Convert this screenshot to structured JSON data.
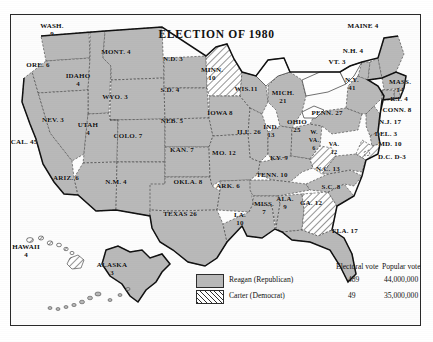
{
  "map": {
    "title": "ELECTION OF 1980"
  },
  "legend": {
    "header_electoral": "Electoral vote",
    "header_popular": "Popular vote",
    "rows": [
      {
        "key": "reagan",
        "swatch": "solid-gray-swatch",
        "name": "Reagan (Republican)",
        "electoral": "489",
        "popular": "44,000,000",
        "color": "#b9b9b9"
      },
      {
        "key": "carter",
        "swatch": "diagonal-hatch-swatch",
        "name": "Carter (Democrat)",
        "electoral": "49",
        "popular": "35,000,000",
        "color": "#ffffff"
      }
    ]
  },
  "states": [
    {
      "id": "wash",
      "label": "WASH.",
      "votes": "9",
      "winner": "reagan",
      "x": 52,
      "y": 30
    },
    {
      "id": "ore",
      "label": "ORE. 6",
      "votes": "",
      "winner": "reagan",
      "x": 35,
      "y": 64
    },
    {
      "id": "idaho",
      "label": "IDAHO",
      "votes": "4",
      "winner": "reagan",
      "x": 76,
      "y": 78
    },
    {
      "id": "mont",
      "label": "MONT. 4",
      "votes": "",
      "winner": "reagan",
      "x": 113,
      "y": 53
    },
    {
      "id": "wyo",
      "label": "WYO. 3",
      "votes": "",
      "winner": "reagan",
      "x": 113,
      "y": 94
    },
    {
      "id": "nev",
      "label": "NEV. 3",
      "votes": "",
      "winner": "reagan",
      "x": 52,
      "y": 119
    },
    {
      "id": "utah",
      "label": "UTAH",
      "votes": "4",
      "winner": "reagan",
      "x": 86,
      "y": 127
    },
    {
      "id": "cal",
      "label": "CAL. 45",
      "votes": "",
      "winner": "reagan",
      "x": 22,
      "y": 143
    },
    {
      "id": "ariz",
      "label": "ARIZ. 6",
      "votes": "",
      "winner": "reagan",
      "x": 64,
      "y": 176
    },
    {
      "id": "colo",
      "label": "COLO. 7",
      "votes": "",
      "winner": "reagan",
      "x": 125,
      "y": 135
    },
    {
      "id": "nm",
      "label": "N.M. 4",
      "votes": "",
      "winner": "reagan",
      "x": 114,
      "y": 181
    },
    {
      "id": "nd",
      "label": "N.D. 3",
      "votes": "",
      "winner": "reagan",
      "x": 172,
      "y": 60
    },
    {
      "id": "sd",
      "label": "S.D. 4",
      "votes": "",
      "winner": "reagan",
      "x": 168,
      "y": 90
    },
    {
      "id": "neb",
      "label": "NEB. 5",
      "votes": "",
      "winner": "reagan",
      "x": 170,
      "y": 120
    },
    {
      "id": "kan",
      "label": "KAN. 7",
      "votes": "",
      "winner": "reagan",
      "x": 180,
      "y": 148
    },
    {
      "id": "okla",
      "label": "OKLA. 8",
      "votes": "",
      "winner": "reagan",
      "x": 187,
      "y": 180
    },
    {
      "id": "texas",
      "label": "TEXAS 26",
      "votes": "",
      "winner": "reagan",
      "x": 180,
      "y": 213
    },
    {
      "id": "minn",
      "label": "MINN.",
      "votes": "10",
      "winner": "carter",
      "x": 211,
      "y": 73
    },
    {
      "id": "iowa",
      "label": "IOWA 8",
      "votes": "",
      "winner": "reagan",
      "x": 218,
      "y": 113
    },
    {
      "id": "mo",
      "label": "MO. 12",
      "votes": "",
      "winner": "reagan",
      "x": 222,
      "y": 152
    },
    {
      "id": "ark",
      "label": "ARK. 6",
      "votes": "",
      "winner": "reagan",
      "x": 226,
      "y": 185
    },
    {
      "id": "la",
      "label": "LA.",
      "votes": "10",
      "winner": "reagan",
      "x": 238,
      "y": 218
    },
    {
      "id": "wis",
      "label": "WIS.11",
      "votes": "",
      "winner": "reagan",
      "x": 245,
      "y": 88
    },
    {
      "id": "ill",
      "label": "ILL. 26",
      "votes": "",
      "winner": "reagan",
      "x": 247,
      "y": 131
    },
    {
      "id": "miss",
      "label": "MISS.",
      "votes": "7",
      "winner": "reagan",
      "x": 262,
      "y": 207
    },
    {
      "id": "mich",
      "label": "MICH.",
      "votes": "21",
      "winner": "reagan",
      "x": 281,
      "y": 96
    },
    {
      "id": "ind",
      "label": "IND.",
      "votes": "13",
      "winner": "reagan",
      "x": 270,
      "y": 132
    },
    {
      "id": "ohio",
      "label": "OHIO",
      "votes": "25",
      "winner": "reagan",
      "x": 296,
      "y": 126
    },
    {
      "id": "ky",
      "label": "KY. 9",
      "votes": "",
      "winner": "reagan",
      "x": 278,
      "y": 158
    },
    {
      "id": "tenn",
      "label": "TENN. 10",
      "votes": "",
      "winner": "reagan",
      "x": 271,
      "y": 174
    },
    {
      "id": "ala",
      "label": "ALA.",
      "votes": "9",
      "winner": "reagan",
      "x": 284,
      "y": 202
    },
    {
      "id": "ga",
      "label": "GA. 12",
      "votes": "",
      "winner": "carter",
      "x": 310,
      "y": 203
    },
    {
      "id": "fla",
      "label": "FLA. 17",
      "votes": "",
      "winner": "reagan",
      "x": 344,
      "y": 230
    },
    {
      "id": "sc",
      "label": "S.C. 8",
      "votes": "",
      "winner": "reagan",
      "x": 330,
      "y": 186
    },
    {
      "id": "nc",
      "label": "N.C. 13",
      "votes": "",
      "winner": "reagan",
      "x": 327,
      "y": 168
    },
    {
      "id": "wva",
      "label": "W.",
      "votes": "VA. 6",
      "winner": "carter",
      "x": 314,
      "y": 139
    },
    {
      "id": "va",
      "label": "VA.",
      "votes": "12",
      "winner": "reagan",
      "x": 333,
      "y": 146
    },
    {
      "id": "penn",
      "label": "PENN. 27",
      "votes": "",
      "winner": "reagan",
      "x": 325,
      "y": 112
    },
    {
      "id": "ny",
      "label": "N.Y.",
      "votes": "41",
      "winner": "reagan",
      "x": 350,
      "y": 83
    },
    {
      "id": "vt",
      "label": "VT. 3",
      "votes": "",
      "winner": "reagan",
      "x": 336,
      "y": 61
    },
    {
      "id": "nh",
      "label": "N.H. 4",
      "votes": "",
      "winner": "reagan",
      "x": 352,
      "y": 51
    },
    {
      "id": "maine",
      "label": "MAINE 4",
      "votes": "",
      "winner": "reagan",
      "x": 362,
      "y": 27
    },
    {
      "id": "mass",
      "label": "MASS.",
      "votes": "14",
      "winner": "reagan",
      "x": 399,
      "y": 85
    },
    {
      "id": "ri",
      "label": "R.I. 4",
      "votes": "",
      "winner": "reagan",
      "x": 399,
      "y": 97
    },
    {
      "id": "conn",
      "label": "CONN. 8",
      "votes": "",
      "winner": "reagan",
      "x": 396,
      "y": 109
    },
    {
      "id": "nj",
      "label": "N.J. 17",
      "votes": "",
      "winner": "reagan",
      "x": 389,
      "y": 121
    },
    {
      "id": "del",
      "label": "DEL. 3",
      "votes": "",
      "winner": "reagan",
      "x": 385,
      "y": 133
    },
    {
      "id": "md",
      "label": "MD. 10",
      "votes": "",
      "winner": "carter",
      "x": 389,
      "y": 143
    },
    {
      "id": "dc",
      "label": "D.C. D-3",
      "votes": "",
      "winner": "carter",
      "x": 390,
      "y": 156
    },
    {
      "id": "alaska",
      "label": "ALASKA",
      "votes": "3",
      "winner": "reagan",
      "x": 110,
      "y": 268
    },
    {
      "id": "hawaii",
      "label": "HAWAII",
      "votes": "4",
      "winner": "carter",
      "x": 24,
      "y": 250
    }
  ]
}
